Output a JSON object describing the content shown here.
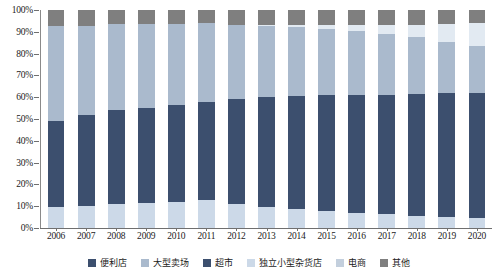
{
  "chart_data": {
    "type": "bar",
    "stacked": true,
    "stack_mode": "percent",
    "title": "",
    "subtitle": "",
    "xlabel": "",
    "ylabel": "",
    "ylim": [
      0,
      100
    ],
    "ytick_labels": [
      "0%",
      "10%",
      "20%",
      "30%",
      "40%",
      "50%",
      "60%",
      "70%",
      "80%",
      "90%",
      "100%"
    ],
    "ytick_values": [
      0,
      10,
      20,
      30,
      40,
      50,
      60,
      70,
      80,
      90,
      100
    ],
    "grid": false,
    "legend_position": "bottom",
    "categories": [
      "2006",
      "2007",
      "2008",
      "2009",
      "2010",
      "2011",
      "2012",
      "2013",
      "2014",
      "2015",
      "2016",
      "2017",
      "2018",
      "2019",
      "2020"
    ],
    "series": [
      {
        "name": "独立小型杂货店",
        "color": "#ccd9e8",
        "values": [
          9.5,
          10.0,
          11.0,
          11.5,
          12.0,
          13.0,
          11.0,
          9.5,
          8.5,
          8.0,
          7.0,
          6.5,
          5.5,
          5.0,
          4.5
        ]
      },
      {
        "name": "超市",
        "color": "#3c4f6e",
        "values": [
          39.5,
          42.0,
          43.0,
          43.5,
          44.5,
          45.0,
          48.0,
          50.5,
          52.0,
          53.0,
          54.0,
          54.5,
          56.0,
          57.0,
          57.5
        ]
      },
      {
        "name": "大型卖场",
        "color": "#aabacd",
        "values": [
          43.5,
          40.5,
          39.5,
          38.5,
          37.0,
          36.0,
          34.0,
          32.5,
          31.5,
          30.5,
          29.5,
          28.0,
          26.0,
          23.5,
          21.5
        ]
      },
      {
        "name": "电商",
        "color": "#e2eaf2",
        "values": [
          0.0,
          0.0,
          0.0,
          0.0,
          0.0,
          0.0,
          0.0,
          0.5,
          1.0,
          1.5,
          2.5,
          4.0,
          5.5,
          8.0,
          10.5
        ]
      },
      {
        "name": "便利店",
        "color": "#3c4f6e",
        "values": [
          0.0,
          0.0,
          0.0,
          0.0,
          0.0,
          0.0,
          0.0,
          0.0,
          0.0,
          0.0,
          0.0,
          0.0,
          0.0,
          0.0,
          0.0
        ]
      },
      {
        "name": "其他",
        "color": "#7f7f7f",
        "values": [
          7.5,
          7.5,
          6.5,
          6.5,
          6.5,
          6.0,
          7.0,
          7.0,
          7.0,
          7.0,
          7.0,
          7.0,
          7.0,
          6.5,
          6.0
        ]
      }
    ]
  },
  "legend": {
    "items": [
      {
        "label": "便利店",
        "color": "#3c4f6e"
      },
      {
        "label": "大型卖场",
        "color": "#aabacd"
      },
      {
        "label": "超市",
        "color": "#3c4f6e"
      },
      {
        "label": "独立小型杂货店",
        "color": "#ccd9e8"
      },
      {
        "label": "电商",
        "color": "#c3cfdd"
      },
      {
        "label": "其他",
        "color": "#7f7f7f"
      }
    ]
  },
  "axis": {
    "line_color": "#6f6f6f"
  }
}
